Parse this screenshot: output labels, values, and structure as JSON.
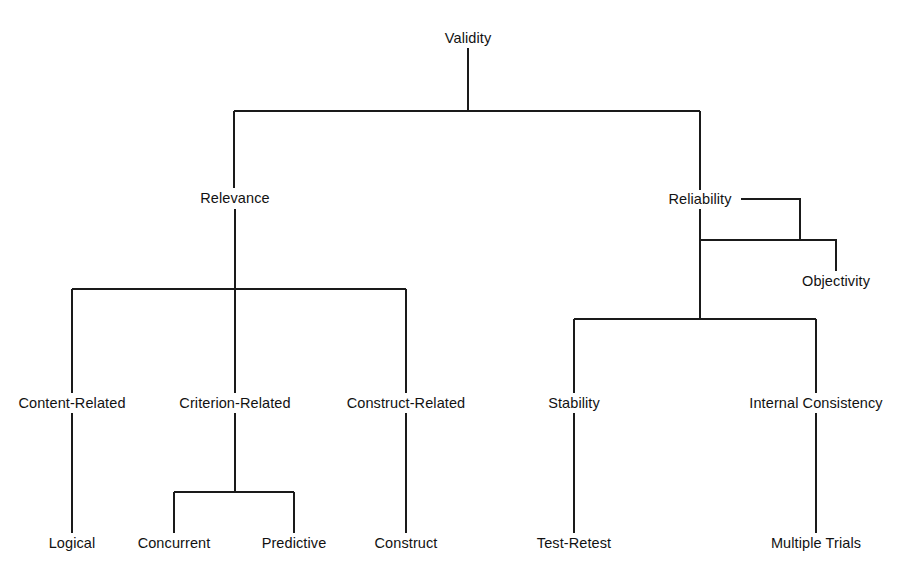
{
  "diagram": {
    "title": "Validity",
    "type": "hierarchy-tree",
    "line_color": "#1a1a1a",
    "background_color": "#ffffff",
    "text_color": "#121212",
    "nodes": [
      {
        "id": "validity",
        "label": "Validity",
        "x": 468,
        "y": 38,
        "level": 0
      },
      {
        "id": "relevance",
        "label": "Relevance",
        "x": 235,
        "y": 198,
        "level": 1
      },
      {
        "id": "reliability",
        "label": "Reliability",
        "x": 700,
        "y": 199,
        "level": 1
      },
      {
        "id": "objectivity",
        "label": "Objectivity",
        "x": 836,
        "y": 281,
        "level": 2
      },
      {
        "id": "content-related",
        "label": "Content-Related",
        "x": 72,
        "y": 403,
        "level": 2
      },
      {
        "id": "criterion-related",
        "label": "Criterion-Related",
        "x": 235,
        "y": 403,
        "level": 2
      },
      {
        "id": "construct-related",
        "label": "Construct-Related",
        "x": 406,
        "y": 403,
        "level": 2
      },
      {
        "id": "stability",
        "label": "Stability",
        "x": 574,
        "y": 403,
        "level": 2
      },
      {
        "id": "internal-consistency",
        "label": "Internal Consistency",
        "x": 816,
        "y": 403,
        "level": 2
      },
      {
        "id": "logical",
        "label": "Logical",
        "x": 72,
        "y": 543,
        "level": 3
      },
      {
        "id": "concurrent",
        "label": "Concurrent",
        "x": 174,
        "y": 543,
        "level": 3
      },
      {
        "id": "predictive",
        "label": "Predictive",
        "x": 294,
        "y": 543,
        "level": 3
      },
      {
        "id": "construct",
        "label": "Construct",
        "x": 406,
        "y": 543,
        "level": 3
      },
      {
        "id": "test-retest",
        "label": "Test-Retest",
        "x": 574,
        "y": 543,
        "level": 3
      },
      {
        "id": "multiple-trials",
        "label": "Multiple Trials",
        "x": 816,
        "y": 543,
        "level": 3
      }
    ],
    "edges": [
      {
        "from": "validity",
        "to": "relevance",
        "kind": "elbow"
      },
      {
        "from": "validity",
        "to": "reliability",
        "kind": "elbow"
      },
      {
        "from": "reliability",
        "to": "objectivity",
        "kind": "side-elbow"
      },
      {
        "from": "relevance",
        "to": "content-related",
        "kind": "elbow"
      },
      {
        "from": "relevance",
        "to": "criterion-related",
        "kind": "straight"
      },
      {
        "from": "relevance",
        "to": "construct-related",
        "kind": "elbow"
      },
      {
        "from": "reliability",
        "to": "stability",
        "kind": "elbow"
      },
      {
        "from": "reliability",
        "to": "internal-consistency",
        "kind": "elbow"
      },
      {
        "from": "content-related",
        "to": "logical",
        "kind": "straight"
      },
      {
        "from": "criterion-related",
        "to": "concurrent",
        "kind": "elbow"
      },
      {
        "from": "criterion-related",
        "to": "predictive",
        "kind": "elbow"
      },
      {
        "from": "construct-related",
        "to": "construct",
        "kind": "straight"
      },
      {
        "from": "stability",
        "to": "test-retest",
        "kind": "straight"
      },
      {
        "from": "internal-consistency",
        "to": "multiple-trials",
        "kind": "straight"
      }
    ]
  }
}
